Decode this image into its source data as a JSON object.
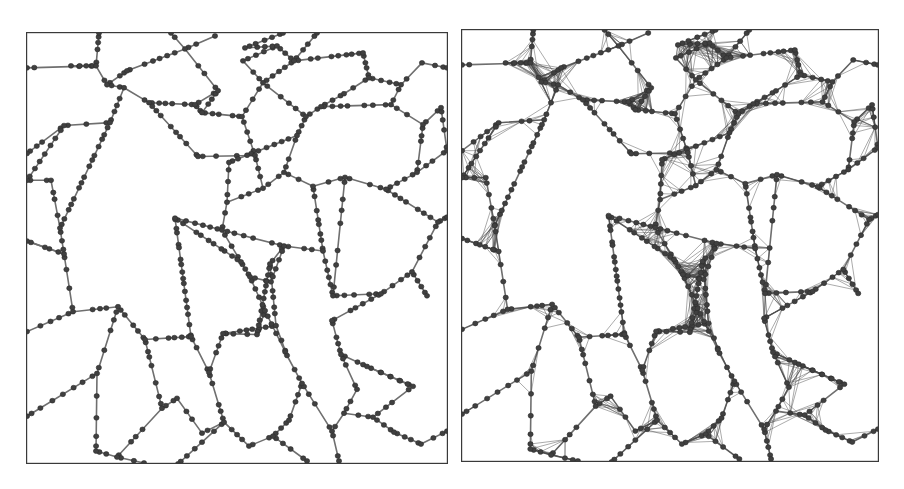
{
  "figure": {
    "panels": [
      {
        "id": "left",
        "label": "",
        "x": 26,
        "y": 32,
        "w": 420,
        "h": 430,
        "style": "sparse"
      },
      {
        "id": "right",
        "label": "",
        "x": 461,
        "y": 29,
        "w": 416,
        "h": 431,
        "style": "dense"
      }
    ],
    "colors": {
      "background": "#ffffff",
      "frame": "#3a3a3a",
      "edge": "#6f6f6f",
      "node": "#404040",
      "fine_edge": "#4a4a4a"
    }
  },
  "graph": {
    "vertices": [
      [
        0,
        35
      ],
      [
        44,
        33
      ],
      [
        72,
        0
      ],
      [
        69,
        33
      ],
      [
        80,
        52
      ],
      [
        100,
        38
      ],
      [
        158,
        16
      ],
      [
        144,
        0
      ],
      [
        188,
        3
      ],
      [
        191,
        58
      ],
      [
        168,
        72
      ],
      [
        122,
        70
      ],
      [
        97,
        55
      ],
      [
        83,
        90
      ],
      [
        37,
        93
      ],
      [
        0,
        121
      ],
      [
        0,
        148
      ],
      [
        24,
        148
      ],
      [
        33,
        196
      ],
      [
        37,
        222
      ],
      [
        0,
        209
      ],
      [
        0,
        300
      ],
      [
        46,
        280
      ],
      [
        91,
        275
      ],
      [
        70,
        342
      ],
      [
        0,
        385
      ],
      [
        69,
        420
      ],
      [
        90,
        426
      ],
      [
        135,
        377
      ],
      [
        118,
        308
      ],
      [
        164,
        305
      ],
      [
        182,
        341
      ],
      [
        197,
        391
      ],
      [
        151,
        433
      ],
      [
        175,
        402
      ],
      [
        150,
        367
      ],
      [
        196,
        302
      ],
      [
        230,
        303
      ],
      [
        238,
        279
      ],
      [
        223,
        245
      ],
      [
        244,
        250
      ],
      [
        214,
        230
      ],
      [
        195,
        198
      ],
      [
        200,
        170
      ],
      [
        236,
        156
      ],
      [
        228,
        123
      ],
      [
        171,
        124
      ],
      [
        175,
        80
      ],
      [
        215,
        84
      ],
      [
        236,
        50
      ],
      [
        216,
        28
      ],
      [
        250,
        13
      ],
      [
        267,
        28
      ],
      [
        290,
        0
      ],
      [
        336,
        20
      ],
      [
        342,
        45
      ],
      [
        317,
        61
      ],
      [
        294,
        74
      ],
      [
        279,
        84
      ],
      [
        270,
        103
      ],
      [
        257,
        140
      ],
      [
        286,
        154
      ],
      [
        318,
        145
      ],
      [
        359,
        157
      ],
      [
        390,
        140
      ],
      [
        420,
        118
      ],
      [
        396,
        92
      ],
      [
        364,
        72
      ],
      [
        374,
        52
      ],
      [
        395,
        30
      ],
      [
        420,
        35
      ],
      [
        414,
        75
      ],
      [
        411,
        190
      ],
      [
        420,
        185
      ],
      [
        385,
        240
      ],
      [
        400,
        264
      ],
      [
        354,
        262
      ],
      [
        306,
        264
      ],
      [
        296,
        219
      ],
      [
        257,
        214
      ],
      [
        243,
        232
      ],
      [
        249,
        294
      ],
      [
        260,
        324
      ],
      [
        275,
        352
      ],
      [
        262,
        389
      ],
      [
        246,
        405
      ],
      [
        222,
        415
      ],
      [
        280,
        430
      ],
      [
        305,
        400
      ],
      [
        317,
        382
      ],
      [
        346,
        386
      ],
      [
        367,
        401
      ],
      [
        394,
        413
      ],
      [
        420,
        400
      ],
      [
        386,
        355
      ],
      [
        340,
        335
      ],
      [
        314,
        323
      ],
      [
        305,
        289
      ],
      [
        330,
        358
      ],
      [
        202,
        130
      ],
      [
        148,
        186
      ],
      [
        218,
        15
      ],
      [
        256,
        0
      ],
      [
        117,
        432
      ],
      [
        312,
        430
      ]
    ],
    "edges": [
      [
        0,
        3
      ],
      [
        3,
        4
      ],
      [
        1,
        3
      ],
      [
        2,
        3
      ],
      [
        4,
        5
      ],
      [
        5,
        6
      ],
      [
        6,
        7
      ],
      [
        6,
        8
      ],
      [
        6,
        9
      ],
      [
        9,
        10
      ],
      [
        10,
        11
      ],
      [
        11,
        12
      ],
      [
        12,
        4
      ],
      [
        12,
        13
      ],
      [
        13,
        14
      ],
      [
        14,
        15
      ],
      [
        14,
        16
      ],
      [
        16,
        17
      ],
      [
        17,
        18
      ],
      [
        18,
        19
      ],
      [
        19,
        20
      ],
      [
        18,
        13
      ],
      [
        19,
        22
      ],
      [
        22,
        23
      ],
      [
        23,
        24
      ],
      [
        24,
        25
      ],
      [
        24,
        26
      ],
      [
        26,
        27
      ],
      [
        27,
        28
      ],
      [
        28,
        29
      ],
      [
        29,
        23
      ],
      [
        29,
        30
      ],
      [
        30,
        31
      ],
      [
        31,
        32
      ],
      [
        32,
        33
      ],
      [
        32,
        34
      ],
      [
        34,
        35
      ],
      [
        35,
        28
      ],
      [
        31,
        36
      ],
      [
        36,
        37
      ],
      [
        37,
        38
      ],
      [
        38,
        39
      ],
      [
        39,
        40
      ],
      [
        39,
        41
      ],
      [
        41,
        42
      ],
      [
        42,
        43
      ],
      [
        43,
        44
      ],
      [
        44,
        45
      ],
      [
        45,
        46
      ],
      [
        46,
        11
      ],
      [
        45,
        48
      ],
      [
        48,
        47
      ],
      [
        47,
        10
      ],
      [
        47,
        9
      ],
      [
        48,
        49
      ],
      [
        49,
        50
      ],
      [
        50,
        51
      ],
      [
        51,
        52
      ],
      [
        52,
        49
      ],
      [
        52,
        53
      ],
      [
        51,
        101
      ],
      [
        101,
        102
      ],
      [
        52,
        54
      ],
      [
        54,
        55
      ],
      [
        55,
        56
      ],
      [
        56,
        57
      ],
      [
        57,
        58
      ],
      [
        58,
        49
      ],
      [
        58,
        59
      ],
      [
        59,
        60
      ],
      [
        60,
        44
      ],
      [
        60,
        61
      ],
      [
        61,
        62
      ],
      [
        62,
        63
      ],
      [
        63,
        64
      ],
      [
        64,
        65
      ],
      [
        64,
        66
      ],
      [
        66,
        67
      ],
      [
        67,
        68
      ],
      [
        68,
        69
      ],
      [
        69,
        70
      ],
      [
        68,
        55
      ],
      [
        66,
        71
      ],
      [
        71,
        65
      ],
      [
        63,
        72
      ],
      [
        72,
        73
      ],
      [
        72,
        74
      ],
      [
        74,
        75
      ],
      [
        74,
        76
      ],
      [
        76,
        77
      ],
      [
        77,
        62
      ],
      [
        77,
        78
      ],
      [
        78,
        79
      ],
      [
        79,
        42
      ],
      [
        79,
        80
      ],
      [
        80,
        81
      ],
      [
        81,
        36
      ],
      [
        81,
        82
      ],
      [
        82,
        83
      ],
      [
        83,
        84
      ],
      [
        84,
        85
      ],
      [
        85,
        86
      ],
      [
        86,
        32
      ],
      [
        85,
        87
      ],
      [
        83,
        88
      ],
      [
        88,
        89
      ],
      [
        89,
        90
      ],
      [
        90,
        91
      ],
      [
        91,
        92
      ],
      [
        92,
        93
      ],
      [
        90,
        94
      ],
      [
        94,
        95
      ],
      [
        95,
        96
      ],
      [
        96,
        97
      ],
      [
        97,
        76
      ],
      [
        96,
        98
      ],
      [
        98,
        89
      ],
      [
        95,
        94
      ],
      [
        59,
        99
      ],
      [
        99,
        43
      ],
      [
        41,
        100
      ],
      [
        100,
        30
      ],
      [
        40,
        79
      ],
      [
        38,
        82
      ],
      [
        61,
        78
      ],
      [
        57,
        67
      ],
      [
        27,
        103
      ],
      [
        88,
        104
      ],
      [
        20,
        19
      ],
      [
        21,
        22
      ],
      [
        100,
        42
      ],
      [
        37,
        80
      ]
    ]
  },
  "chart_data": {
    "type": "network_graph",
    "title": "",
    "panels": [
      {
        "name": "left",
        "description": "Sparse network of nodes along Voronoi-like cell edges; uniform gray links, nodes chained along each edge"
      },
      {
        "name": "right",
        "description": "Same network topology with dense fine-line clusters (many crossing links) near junctions; cells appear rounded"
      }
    ],
    "xlabel": "",
    "ylabel": "",
    "legend": [],
    "grid": false
  }
}
